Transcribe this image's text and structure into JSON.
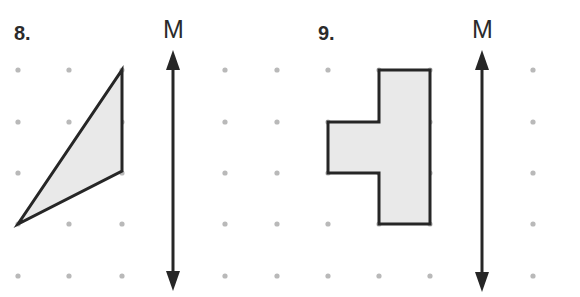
{
  "problems": [
    {
      "number": "8.",
      "mirror_label": "M",
      "shape": "triangle",
      "grid": {
        "cols_x": [
          18,
          69,
          122,
          173,
          225,
          277
        ],
        "rows_y": [
          70,
          122,
          173,
          224,
          276
        ]
      },
      "vertices": [
        [
          122,
          70
        ],
        [
          122,
          171
        ],
        [
          18,
          224
        ]
      ],
      "mirror_line": {
        "x": 173,
        "y_top": 50,
        "y_bottom": 291
      }
    },
    {
      "number": "9.",
      "mirror_label": "M",
      "shape": "t-shape",
      "grid": {
        "cols_x": [
          328,
          379,
          430,
          482,
          533
        ],
        "rows_y": [
          70,
          122,
          173,
          224,
          276
        ]
      },
      "vertices": [
        [
          379,
          70
        ],
        [
          430,
          70
        ],
        [
          430,
          224
        ],
        [
          379,
          224
        ],
        [
          379,
          173
        ],
        [
          328,
          173
        ],
        [
          328,
          122
        ],
        [
          379,
          122
        ]
      ],
      "mirror_line": {
        "x": 482,
        "y_top": 50,
        "y_bottom": 292
      }
    }
  ],
  "colors": {
    "shape_fill": "#e9e9e9",
    "stroke": "#262626",
    "dot": "#b9b9b9"
  }
}
